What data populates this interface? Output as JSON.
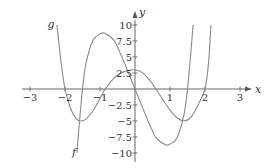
{
  "chart_data": {
    "type": "line",
    "title": "",
    "xlabel": "x",
    "ylabel": "y",
    "xlim": [
      -3,
      3
    ],
    "ylim": [
      -10,
      10
    ],
    "grid": false,
    "legend": "none (curves labeled inline)",
    "x_ticks": [
      -3,
      -2,
      -1,
      1,
      2,
      3
    ],
    "x_tick_labels": [
      "−3",
      "−2",
      "−1",
      "1",
      "2",
      "3"
    ],
    "y_ticks": [
      10,
      7.5,
      5,
      2.5,
      -2.5,
      -5,
      -7.5,
      -10
    ],
    "y_tick_labels": [
      "10",
      "7.5",
      "5",
      "2.5",
      "−2.5",
      "−5",
      "−7.5",
      "−10"
    ],
    "series": [
      {
        "name": "f",
        "label_position": [
          -1.8,
          -10.5
        ],
        "points": [
          [
            -1.66,
            -10
          ],
          [
            -1.6,
            -6
          ],
          [
            -1.5,
            0
          ],
          [
            -1.4,
            4
          ],
          [
            -1.2,
            7.6
          ],
          [
            -1.0,
            8.6
          ],
          [
            -0.87,
            8.7
          ],
          [
            -0.6,
            7.6
          ],
          [
            -0.4,
            5.3
          ],
          [
            -0.2,
            2.7
          ],
          [
            0,
            0
          ],
          [
            0.2,
            -2.7
          ],
          [
            0.4,
            -5.3
          ],
          [
            0.6,
            -7.6
          ],
          [
            0.87,
            -8.7
          ],
          [
            1.0,
            -8.6
          ],
          [
            1.2,
            -7.6
          ],
          [
            1.4,
            -4
          ],
          [
            1.5,
            0
          ],
          [
            1.6,
            6
          ],
          [
            1.66,
            10
          ]
        ]
      },
      {
        "name": "g",
        "label_position": [
          -2.5,
          9.5
        ],
        "points": [
          [
            -2.23,
            10
          ],
          [
            -2.12,
            4.5
          ],
          [
            -2,
            0
          ],
          [
            -1.85,
            -2.9
          ],
          [
            -1.7,
            -4.5
          ],
          [
            -1.55,
            -5
          ],
          [
            -1.4,
            -4.7
          ],
          [
            -1.2,
            -3.4
          ],
          [
            -1.0,
            -1.5
          ],
          [
            -0.85,
            0
          ],
          [
            -0.6,
            1.7
          ],
          [
            -0.4,
            2.5
          ],
          [
            -0.2,
            2.9
          ],
          [
            0,
            3
          ],
          [
            0.2,
            2.6
          ],
          [
            0.4,
            1.5
          ],
          [
            0.6,
            0
          ],
          [
            0.8,
            -1.7
          ],
          [
            1.0,
            -3.3
          ],
          [
            1.2,
            -4.5
          ],
          [
            1.4,
            -5
          ],
          [
            1.6,
            -4.4
          ],
          [
            1.8,
            -2.5
          ],
          [
            2.0,
            0
          ],
          [
            2.1,
            4
          ],
          [
            2.17,
            10
          ]
        ]
      }
    ]
  },
  "colors": {
    "axis": "#555555",
    "curve": "#8a8a8a",
    "text": "#333333"
  }
}
